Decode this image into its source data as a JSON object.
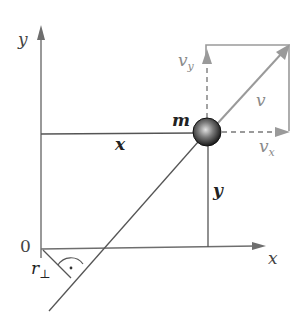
{
  "diagram": {
    "type": "physics-vector-diagram",
    "topic": "angular momentum of point mass",
    "colors": {
      "axis": "#6e6e6e",
      "line": "#555555",
      "vector": "#9a9a9a",
      "vector_label": "#8a8a8a",
      "text": "#222222",
      "mass_dark": "#1a1a1a",
      "mass_light": "#d8d8d8"
    },
    "labels": {
      "y_axis": "y",
      "x_axis": "x",
      "origin": "0",
      "mass": "m",
      "x_distance": "x",
      "y_distance": "y",
      "velocity": "v",
      "velocity_x": "v",
      "velocity_x_sub": "x",
      "velocity_y": "v",
      "velocity_y_sub": "y",
      "perp_distance": "r",
      "perp_symbol": "⊥",
      "right_angle_dot": "·"
    }
  }
}
